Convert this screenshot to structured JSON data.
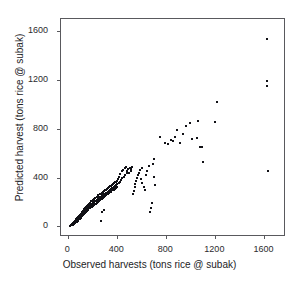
{
  "chart_data": {
    "type": "scatter",
    "title": "",
    "xlabel": "Observed harvests (tons rice @ subak)",
    "ylabel": "Predicted harvest (tons rice @ subak)",
    "xlim": [
      -60,
      1760
    ],
    "ylim": [
      -70,
      1700
    ],
    "xticks": [
      0,
      400,
      800,
      1200,
      1600
    ],
    "yticks": [
      0,
      400,
      800,
      1200,
      1600
    ],
    "xticklabels": [
      "0",
      "400",
      "800",
      "1200",
      "1600"
    ],
    "yticklabels": [
      "0",
      "400",
      "800",
      "1200",
      "1600"
    ],
    "grid": false,
    "legend": null,
    "marker": "square",
    "marker_color": "#111116",
    "marker_size": 2,
    "n_points": 198,
    "points": [
      [
        15,
        5
      ],
      [
        22,
        10
      ],
      [
        28,
        18
      ],
      [
        30,
        8
      ],
      [
        35,
        25
      ],
      [
        38,
        14
      ],
      [
        42,
        30
      ],
      [
        45,
        40
      ],
      [
        48,
        22
      ],
      [
        52,
        35
      ],
      [
        55,
        48
      ],
      [
        58,
        28
      ],
      [
        60,
        55
      ],
      [
        63,
        42
      ],
      [
        66,
        60
      ],
      [
        70,
        35
      ],
      [
        72,
        68
      ],
      [
        75,
        52
      ],
      [
        78,
        75
      ],
      [
        80,
        45
      ],
      [
        84,
        82
      ],
      [
        86,
        62
      ],
      [
        90,
        70
      ],
      [
        92,
        95
      ],
      [
        95,
        58
      ],
      [
        98,
        88
      ],
      [
        100,
        105
      ],
      [
        104,
        72
      ],
      [
        106,
        98
      ],
      [
        110,
        115
      ],
      [
        112,
        85
      ],
      [
        115,
        108
      ],
      [
        118,
        128
      ],
      [
        120,
        92
      ],
      [
        124,
        118
      ],
      [
        126,
        140
      ],
      [
        130,
        102
      ],
      [
        132,
        125
      ],
      [
        135,
        148
      ],
      [
        138,
        112
      ],
      [
        140,
        135
      ],
      [
        144,
        158
      ],
      [
        146,
        120
      ],
      [
        150,
        145
      ],
      [
        152,
        168
      ],
      [
        155,
        130
      ],
      [
        158,
        155
      ],
      [
        160,
        178
      ],
      [
        164,
        138
      ],
      [
        166,
        162
      ],
      [
        170,
        188
      ],
      [
        172,
        148
      ],
      [
        175,
        170
      ],
      [
        178,
        195
      ],
      [
        180,
        155
      ],
      [
        184,
        178
      ],
      [
        186,
        205
      ],
      [
        190,
        160
      ],
      [
        192,
        185
      ],
      [
        195,
        212
      ],
      [
        198,
        168
      ],
      [
        200,
        192
      ],
      [
        204,
        218
      ],
      [
        206,
        175
      ],
      [
        210,
        198
      ],
      [
        212,
        225
      ],
      [
        215,
        182
      ],
      [
        218,
        205
      ],
      [
        220,
        232
      ],
      [
        224,
        188
      ],
      [
        226,
        212
      ],
      [
        230,
        240
      ],
      [
        232,
        195
      ],
      [
        235,
        218
      ],
      [
        238,
        248
      ],
      [
        240,
        202
      ],
      [
        244,
        225
      ],
      [
        246,
        255
      ],
      [
        250,
        208
      ],
      [
        252,
        232
      ],
      [
        255,
        262
      ],
      [
        258,
        215
      ],
      [
        260,
        238
      ],
      [
        264,
        268
      ],
      [
        266,
        222
      ],
      [
        270,
        245
      ],
      [
        272,
        275
      ],
      [
        275,
        228
      ],
      [
        278,
        252
      ],
      [
        280,
        282
      ],
      [
        284,
        235
      ],
      [
        286,
        258
      ],
      [
        290,
        288
      ],
      [
        292,
        242
      ],
      [
        295,
        265
      ],
      [
        298,
        295
      ],
      [
        300,
        248
      ],
      [
        304,
        272
      ],
      [
        306,
        302
      ],
      [
        310,
        255
      ],
      [
        312,
        278
      ],
      [
        315,
        308
      ],
      [
        318,
        262
      ],
      [
        320,
        285
      ],
      [
        324,
        315
      ],
      [
        326,
        268
      ],
      [
        330,
        292
      ],
      [
        332,
        322
      ],
      [
        335,
        275
      ],
      [
        338,
        298
      ],
      [
        340,
        328
      ],
      [
        344,
        282
      ],
      [
        346,
        305
      ],
      [
        350,
        335
      ],
      [
        352,
        288
      ],
      [
        355,
        312
      ],
      [
        358,
        342
      ],
      [
        360,
        295
      ],
      [
        364,
        318
      ],
      [
        366,
        348
      ],
      [
        370,
        302
      ],
      [
        372,
        325
      ],
      [
        375,
        355
      ],
      [
        378,
        308
      ],
      [
        380,
        332
      ],
      [
        384,
        362
      ],
      [
        386,
        315
      ],
      [
        390,
        338
      ],
      [
        392,
        368
      ],
      [
        395,
        322
      ],
      [
        398,
        345
      ],
      [
        400,
        375
      ],
      [
        405,
        392
      ],
      [
        410,
        355
      ],
      [
        415,
        408
      ],
      [
        420,
        368
      ],
      [
        425,
        430
      ],
      [
        430,
        382
      ],
      [
        435,
        452
      ],
      [
        440,
        395
      ],
      [
        448,
        465
      ],
      [
        452,
        408
      ],
      [
        460,
        475
      ],
      [
        465,
        422
      ],
      [
        470,
        488
      ],
      [
        478,
        435
      ],
      [
        482,
        452
      ],
      [
        490,
        470
      ],
      [
        495,
        442
      ],
      [
        500,
        478
      ],
      [
        508,
        455
      ],
      [
        515,
        468
      ],
      [
        520,
        485
      ],
      [
        528,
        262
      ],
      [
        535,
        292
      ],
      [
        542,
        320
      ],
      [
        548,
        348
      ],
      [
        555,
        375
      ],
      [
        562,
        398
      ],
      [
        570,
        420
      ],
      [
        578,
        442
      ],
      [
        585,
        462
      ],
      [
        590,
        392
      ],
      [
        598,
        355
      ],
      [
        605,
        478
      ],
      [
        615,
        322
      ],
      [
        625,
        298
      ],
      [
        632,
        420
      ],
      [
        645,
        455
      ],
      [
        655,
        492
      ],
      [
        665,
        122
      ],
      [
        672,
        155
      ],
      [
        680,
        195
      ],
      [
        688,
        515
      ],
      [
        695,
        555
      ],
      [
        702,
        408
      ],
      [
        710,
        338
      ],
      [
        265,
        48
      ],
      [
        278,
        115
      ],
      [
        292,
        135
      ],
      [
        745,
        735
      ],
      [
        792,
        680
      ],
      [
        812,
        672
      ],
      [
        838,
        712
      ],
      [
        855,
        700
      ],
      [
        872,
        735
      ],
      [
        885,
        788
      ],
      [
        912,
        685
      ],
      [
        935,
        755
      ],
      [
        962,
        822
      ],
      [
        995,
        848
      ],
      [
        1008,
        718
      ],
      [
        1048,
        728
      ],
      [
        1062,
        862
      ],
      [
        1075,
        655
      ],
      [
        1090,
        648
      ],
      [
        1102,
        530
      ],
      [
        1198,
        852
      ],
      [
        1212,
        1022
      ],
      [
        1618,
        1540
      ],
      [
        1622,
        1195
      ],
      [
        1625,
        1148
      ],
      [
        1628,
        455
      ]
    ]
  },
  "axes": {
    "x_title": "Observed harvests (tons rice @ subak)",
    "y_title": "Predicted harvest (tons rice @ subak)"
  }
}
